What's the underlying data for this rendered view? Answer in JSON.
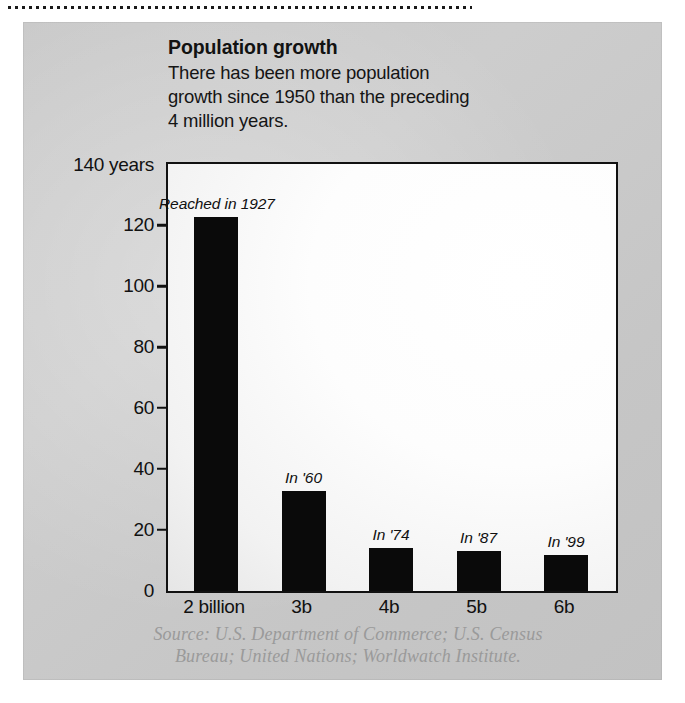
{
  "figure": {
    "title": "Population growth",
    "subtitle": "There has been more population growth since 1950 than the preceding 4 million years.",
    "source_line_1": "Source: U.S. Department of Commerce; U.S. Census",
    "source_line_2": "Bureau; United Nations; Worldwatch Institute."
  },
  "chart_data": {
    "type": "bar",
    "title": "Population growth",
    "subtitle": "There has been more population growth since 1950 than the preceding 4 million years.",
    "xlabel": "",
    "ylabel": "140 years",
    "ylim": [
      0,
      140
    ],
    "grid": false,
    "legend": null,
    "categories": [
      "2 billion",
      "3b",
      "4b",
      "5b",
      "6b"
    ],
    "values": [
      123,
      33,
      14,
      13,
      12
    ],
    "annotations": [
      "Reached in 1927",
      "In '60",
      "In '74",
      "In '87",
      "In '99"
    ],
    "y_ticks": [
      {
        "value": 140,
        "label": "140 years"
      },
      {
        "value": 120,
        "label": "120"
      },
      {
        "value": 100,
        "label": "100"
      },
      {
        "value": 80,
        "label": "80"
      },
      {
        "value": 60,
        "label": "60"
      },
      {
        "value": 40,
        "label": "40"
      },
      {
        "value": 20,
        "label": "20"
      },
      {
        "value": 0,
        "label": "0"
      }
    ],
    "source": "Source: U.S. Department of Commerce; U.S. Census Bureau; United Nations; Worldwatch Institute."
  },
  "colors": {
    "bar": "#0a0a0a",
    "panel": "#c9c9c9",
    "plot_background": "#fdfdfd",
    "axis": "#111111",
    "source_text": "#9a9a9a"
  }
}
